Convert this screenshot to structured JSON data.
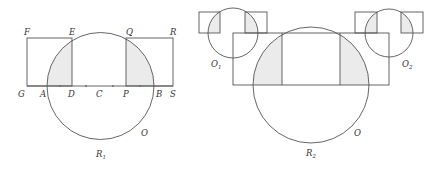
{
  "figure1": {
    "labels": {
      "F": "F",
      "E": "E",
      "Q": "Q",
      "R": "R",
      "G": "G",
      "A": "A",
      "D": "D",
      "C": "C",
      "P": "P",
      "B": "B",
      "S": "S",
      "O": "O",
      "R1": "R",
      "R1_sub": "1"
    }
  },
  "figure2": {
    "labels": {
      "O1": "O",
      "O1_sub": "1",
      "O2": "O",
      "O2_sub": "2",
      "O": "O",
      "R2": "R",
      "R2_sub": "2"
    }
  },
  "colors": {
    "stroke": "#555555",
    "shade": "#ebebeb"
  }
}
